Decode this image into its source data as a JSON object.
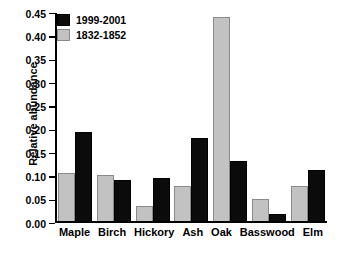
{
  "chart_data": {
    "type": "bar",
    "title": "",
    "xlabel": "",
    "ylabel": "Relative abundance",
    "categories": [
      "Maple",
      "Birch",
      "Hickory",
      "Ash",
      "Oak",
      "Basswood",
      "Elm"
    ],
    "series": [
      {
        "name": "1832-1852",
        "key": "series-old",
        "color": "#c2c2c2",
        "edge_color": "#8a8a8a",
        "values": [
          0.105,
          0.101,
          0.033,
          0.077,
          0.442,
          0.048,
          0.077
        ]
      },
      {
        "name": "1999-2001",
        "key": "series-new",
        "color": "#0b0b0b",
        "edge_color": "#000000",
        "values": [
          0.193,
          0.09,
          0.094,
          0.181,
          0.131,
          0.015,
          0.111
        ]
      }
    ],
    "ylim": [
      0.0,
      0.45
    ],
    "ytick_labels": [
      "0.45",
      "0.40",
      "0.35",
      "0.30",
      "0.25",
      "0.20",
      "0.15",
      "0.10",
      "0.05",
      "0.00"
    ],
    "ytick_values": [
      0.45,
      0.4,
      0.35,
      0.3,
      0.25,
      0.2,
      0.15,
      0.1,
      0.05,
      0.0
    ],
    "grid": false,
    "legend_position": "upper left",
    "legend_order": [
      "1999-2001",
      "1832-1852"
    ]
  }
}
